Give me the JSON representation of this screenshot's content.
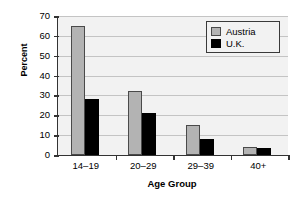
{
  "chart_data": {
    "type": "bar",
    "title": "",
    "xlabel": "Age Group",
    "ylabel": "Percent",
    "categories": [
      "14–19",
      "20–29",
      "29–39",
      "40+"
    ],
    "series": [
      {
        "name": "Austria",
        "color": "#b3b3b3",
        "values": [
          65,
          32,
          15,
          4
        ]
      },
      {
        "name": "U.K.",
        "color": "#000000",
        "values": [
          28,
          21,
          8,
          3.5
        ]
      }
    ],
    "ylim": [
      0,
      70
    ],
    "ytick_step": 10,
    "yticks": [
      70,
      60,
      50,
      40,
      30,
      20,
      10,
      0
    ],
    "ytick_labels": [
      "70",
      "60",
      "50",
      "40",
      "30",
      "20",
      "10",
      "0"
    ],
    "grid": true,
    "grid_axis": "y",
    "legend_position": "top-right",
    "plot_background": "#f2f2f2",
    "figure_background": "#ffffff",
    "axis_color": "#333333",
    "gridline_color": "#c4c4c4"
  },
  "legend": {
    "entries": [
      {
        "label": "Austria",
        "swatch": "austria"
      },
      {
        "label": "U.K.",
        "swatch": "uk"
      }
    ]
  }
}
